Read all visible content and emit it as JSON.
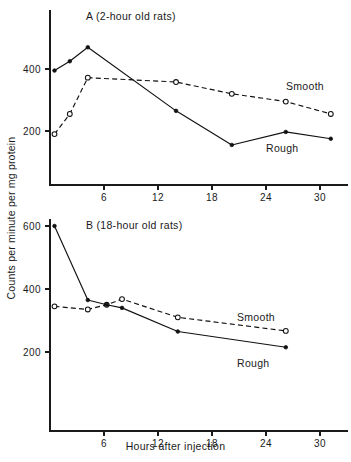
{
  "figure": {
    "ylabel": "Counts per minute per mg protein",
    "xlabel": "Hours after injection"
  },
  "panel_a": {
    "title": "A (2-hour old rats)",
    "label_smooth": "Smooth",
    "label_rough": "Rough",
    "ytick_400": "400",
    "ytick_200": "200",
    "xtick_6": "6",
    "xtick_12": "12",
    "xtick_18": "18",
    "xtick_24": "24",
    "xtick_30": "30"
  },
  "panel_b": {
    "title": "B (18-hour old rats)",
    "label_smooth": "Smooth",
    "label_rough": "Rough",
    "ytick_600": "600",
    "ytick_400": "400",
    "ytick_200": "200",
    "xtick_6": "6",
    "xtick_12": "12",
    "xtick_18": "18",
    "xtick_24": "24",
    "xtick_30": "30"
  },
  "chart_data": [
    {
      "type": "line",
      "title": "A (2-hour old rats)",
      "xlabel": "Hours after injection",
      "ylabel": "Counts per minute per mg protein",
      "xlim": [
        0,
        33
      ],
      "ylim": [
        0,
        520
      ],
      "xticks": [
        6,
        12,
        18,
        24,
        30
      ],
      "yticks": [
        200,
        400
      ],
      "grid": false,
      "legend": "inline-annotation",
      "series": [
        {
          "name": "Rough",
          "style": "solid",
          "marker": "filled-circle",
          "x": [
            0.5,
            2.2,
            4.2,
            14.0,
            20.2,
            26.2,
            31.2
          ],
          "y": [
            395,
            425,
            470,
            265,
            155,
            197,
            175
          ]
        },
        {
          "name": "Smooth",
          "style": "dashed",
          "marker": "open-circle",
          "x": [
            0.5,
            2.2,
            4.2,
            14.0,
            20.2,
            26.2,
            31.2
          ],
          "y": [
            190,
            255,
            372,
            358,
            320,
            295,
            255
          ]
        }
      ]
    },
    {
      "type": "line",
      "title": "B (18-hour old rats)",
      "xlabel": "Hours after injection",
      "ylabel": "Counts per minute per mg protein",
      "xlim": [
        0,
        33
      ],
      "ylim": [
        0,
        660
      ],
      "xticks": [
        6,
        12,
        18,
        24,
        30
      ],
      "yticks": [
        200,
        400,
        600
      ],
      "grid": false,
      "legend": "inline-annotation",
      "series": [
        {
          "name": "Rough",
          "style": "solid",
          "marker": "filled-circle",
          "x": [
            0.5,
            4.2,
            6.3,
            8.0,
            14.2,
            26.2
          ],
          "y": [
            600,
            365,
            350,
            340,
            265,
            215
          ]
        },
        {
          "name": "Smooth",
          "style": "dashed",
          "marker": "open-circle",
          "x": [
            0.5,
            4.2,
            6.3,
            8.0,
            14.2,
            26.2
          ],
          "y": [
            345,
            335,
            350,
            368,
            310,
            267
          ]
        }
      ]
    }
  ]
}
